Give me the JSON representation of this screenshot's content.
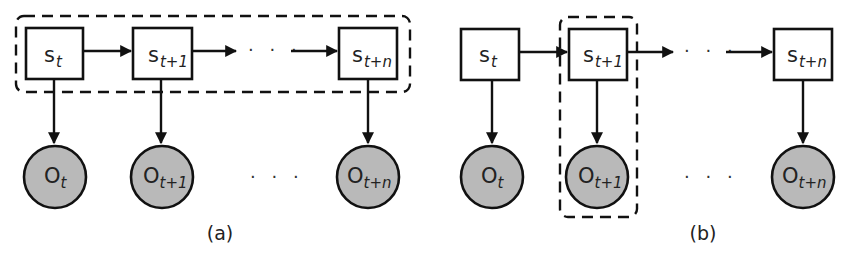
{
  "figure": {
    "panels": [
      {
        "id": "a",
        "caption": "(a)",
        "highlight": "state chain",
        "states": [
          {
            "base": "s",
            "sub": "t"
          },
          {
            "base": "s",
            "sub": "t+1"
          },
          {
            "base": "s",
            "sub": "t+n"
          }
        ],
        "observations": [
          {
            "base": "O",
            "sub": "t"
          },
          {
            "base": "O",
            "sub": "t+1"
          },
          {
            "base": "O",
            "sub": "t+n"
          }
        ],
        "ellipsis": "· · ·"
      },
      {
        "id": "b",
        "caption": "(b)",
        "highlight": "single time step t+1",
        "states": [
          {
            "base": "s",
            "sub": "t"
          },
          {
            "base": "s",
            "sub": "t+1"
          },
          {
            "base": "s",
            "sub": "t+n"
          }
        ],
        "observations": [
          {
            "base": "O",
            "sub": "t"
          },
          {
            "base": "O",
            "sub": "t+1"
          },
          {
            "base": "O",
            "sub": "t+n"
          }
        ],
        "ellipsis": "· · ·"
      }
    ],
    "colors": {
      "stroke": "#111111",
      "observation_fill": "#b9b9b9",
      "state_fill": "#ffffff",
      "background": "#ffffff"
    }
  }
}
